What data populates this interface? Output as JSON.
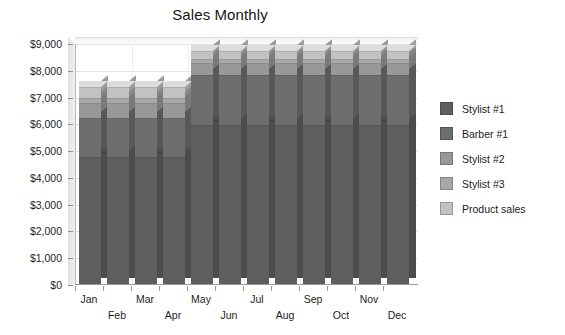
{
  "chart_data": {
    "type": "bar",
    "subtype": "stacked-column-3d",
    "title": "Sales Monthly",
    "xlabel": "",
    "ylabel": "",
    "ylim": [
      0,
      9000
    ],
    "ytick_step": 1000,
    "grid": true,
    "legend_position": "right",
    "value_prefix": "$",
    "categories": [
      "Jan",
      "Feb",
      "Mar",
      "Apr",
      "May",
      "Jun",
      "Jul",
      "Aug",
      "Sep",
      "Oct",
      "Nov",
      "Dec"
    ],
    "ytick_labels": [
      "$9,000",
      "$8,000",
      "$7,000",
      "$6,000",
      "$5,000",
      "$4,000",
      "$3,000",
      "$2,000",
      "$1,000",
      "$0"
    ],
    "ytick_values": [
      9000,
      8000,
      7000,
      6000,
      5000,
      4000,
      3000,
      2000,
      1000,
      0
    ],
    "series": [
      {
        "name": "Stylist #1",
        "color": "#5f5f5f",
        "values": [
          4750,
          4750,
          4750,
          4750,
          5950,
          5950,
          5950,
          5950,
          5950,
          5950,
          5950,
          5950
        ]
      },
      {
        "name": "Barber #1",
        "color": "#6e6e6e",
        "values": [
          1450,
          1450,
          1450,
          1450,
          1850,
          1850,
          1850,
          1850,
          1850,
          1850,
          1850,
          1850
        ]
      },
      {
        "name": "Stylist #2",
        "color": "#989898",
        "values": [
          550,
          550,
          550,
          550,
          450,
          450,
          450,
          450,
          450,
          450,
          450,
          450
        ]
      },
      {
        "name": "Stylist #3",
        "color": "#a8a8a8",
        "values": [
          200,
          200,
          200,
          200,
          150,
          150,
          150,
          150,
          150,
          150,
          150,
          150
        ]
      },
      {
        "name": "Product sales",
        "color": "#c2c2c2",
        "values": [
          400,
          400,
          400,
          400,
          300,
          300,
          300,
          300,
          300,
          300,
          300,
          300
        ]
      }
    ],
    "totals": [
      7350,
      7350,
      7350,
      7350,
      8700,
      8700,
      8700,
      8700,
      8700,
      8700,
      8700,
      8700
    ]
  },
  "legend": {
    "items": [
      {
        "label": "Stylist #1",
        "color": "#5f5f5f"
      },
      {
        "label": "Barber #1",
        "color": "#6e6e6e"
      },
      {
        "label": "Stylist #2",
        "color": "#989898"
      },
      {
        "label": "Stylist #3",
        "color": "#a8a8a8"
      },
      {
        "label": "Product sales",
        "color": "#c2c2c2"
      }
    ]
  },
  "colors": {
    "background": "#ffffff",
    "grid": "#e4e4e4",
    "axis": "#9a9a9a",
    "text": "#1a1a1a"
  }
}
